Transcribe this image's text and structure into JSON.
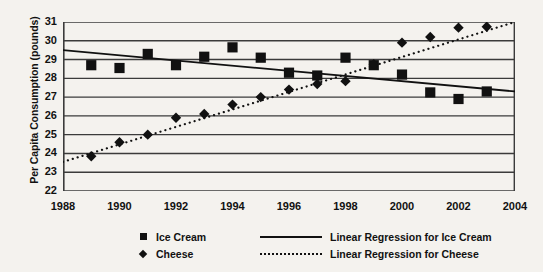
{
  "chart_data": {
    "type": "scatter",
    "title": "",
    "xlabel": "",
    "ylabel": "Per Capita Consumption (pounds)",
    "xlim": [
      1988,
      2004
    ],
    "ylim": [
      22,
      31
    ],
    "xticks": [
      1988,
      1990,
      1992,
      1994,
      1996,
      1998,
      2000,
      2002,
      2004
    ],
    "yticks": [
      22,
      23,
      24,
      25,
      26,
      27,
      28,
      29,
      30,
      31
    ],
    "grid": true,
    "legend_position": "bottom",
    "x": [
      1989,
      1990,
      1991,
      1992,
      1993,
      1994,
      1995,
      1996,
      1997,
      1998,
      1999,
      2000,
      2001,
      2002,
      2003
    ],
    "series": [
      {
        "name": "Ice Cream",
        "marker": "square",
        "color": "#111111",
        "values": [
          28.7,
          28.55,
          29.3,
          28.7,
          29.15,
          29.65,
          29.1,
          28.3,
          28.15,
          29.1,
          28.7,
          28.2,
          27.25,
          26.9,
          27.3
        ]
      },
      {
        "name": "Cheese",
        "marker": "diamond",
        "color": "#111111",
        "values": [
          23.85,
          24.6,
          25.0,
          25.9,
          26.1,
          26.6,
          27.0,
          27.4,
          27.7,
          27.85,
          28.75,
          29.9,
          30.2,
          30.7,
          30.75
        ]
      }
    ],
    "trendlines": [
      {
        "name": "Linear Regression for Ice Cream",
        "style": "solid",
        "color": "#111111",
        "x": [
          1988,
          2004
        ],
        "y": [
          29.5,
          27.3
        ]
      },
      {
        "name": "Linear Regression for Cheese",
        "style": "dotted",
        "color": "#111111",
        "x": [
          1988,
          2004
        ],
        "y": [
          23.55,
          31.0
        ]
      }
    ]
  },
  "legend": {
    "items": [
      {
        "marker_name": "square-marker",
        "label": "Ice Cream",
        "line_name": "solid-line-swatch",
        "line_label": "Linear Regression for Ice Cream"
      },
      {
        "marker_name": "diamond-marker",
        "label": "Cheese",
        "line_name": "dotted-line-swatch",
        "line_label": "Linear Regression for Cheese"
      }
    ]
  }
}
